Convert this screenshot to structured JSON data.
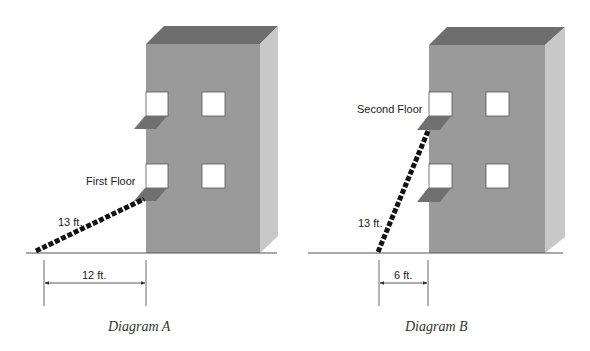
{
  "colors": {
    "front": "#9a9a9a",
    "roof": "#6e6e6e",
    "side": "#c8c8c8",
    "sill": "#707070",
    "window": "#ffffff",
    "ladder": "#111111",
    "line": "#555555"
  },
  "diagram_a": {
    "caption": "Diagram A",
    "floor_label": "First Floor",
    "ladder_length_label": "13 ft.",
    "base_distance_label": "12 ft."
  },
  "diagram_b": {
    "caption": "Diagram B",
    "floor_label": "Second Floor",
    "ladder_length_label": "13 ft.",
    "base_distance_label": "6 ft."
  }
}
